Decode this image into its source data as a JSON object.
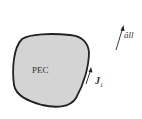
{
  "diagram": {
    "body_label": "PEC",
    "current_label": "J",
    "current_subscript": "1",
    "field_label": "âll",
    "colors": {
      "body_fill": "#d4d4d4",
      "outline": "#222222",
      "text": "#333333"
    }
  }
}
